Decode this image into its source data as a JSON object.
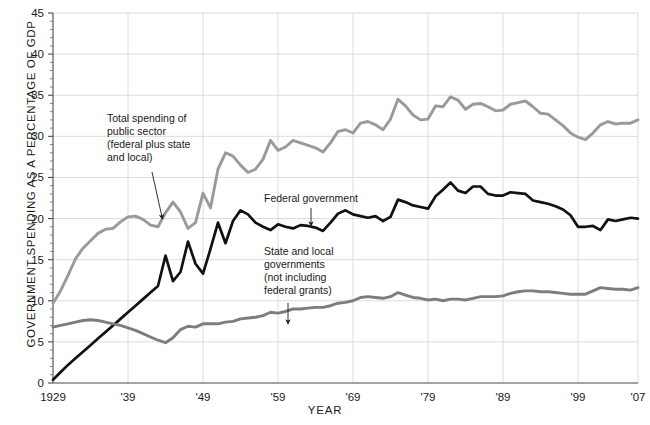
{
  "chart_data": {
    "type": "line",
    "title": "",
    "xlabel": "YEAR",
    "ylabel": "GOVERNMENT SPENDING AS A PERCENTAGE OF GDP",
    "xlim": [
      1929,
      2007
    ],
    "ylim": [
      0,
      45
    ],
    "xticks": [
      1929,
      1939,
      1949,
      1959,
      1969,
      1979,
      1989,
      1999,
      2007
    ],
    "xticklabels": [
      "1929",
      "'39",
      "'49",
      "'59",
      "'69",
      "'79",
      "'89",
      "'99",
      "'07"
    ],
    "yticks": [
      0,
      5,
      10,
      15,
      20,
      25,
      30,
      35,
      40,
      45
    ],
    "yticklabels": [
      "0",
      "5",
      "10",
      "15",
      "20",
      "25",
      "30",
      "35",
      "40",
      "45"
    ],
    "grid": true,
    "legend": "annotations",
    "series": [
      {
        "name": "Total spending of public sector (federal plus state and local)",
        "color": "#9a9a9a",
        "x": [
          1929,
          1930,
          1931,
          1932,
          1933,
          1934,
          1935,
          1936,
          1937,
          1938,
          1939,
          1940,
          1941,
          1942,
          1943,
          1944,
          1945,
          1946,
          1947,
          1948,
          1949,
          1950,
          1951,
          1952,
          1953,
          1954,
          1955,
          1956,
          1957,
          1958,
          1959,
          1960,
          1961,
          1962,
          1963,
          1964,
          1965,
          1966,
          1967,
          1968,
          1969,
          1970,
          1971,
          1972,
          1973,
          1974,
          1975,
          1976,
          1977,
          1978,
          1979,
          1980,
          1981,
          1982,
          1983,
          1984,
          1985,
          1986,
          1987,
          1988,
          1989,
          1990,
          1991,
          1992,
          1993,
          1994,
          1995,
          1996,
          1997,
          1998,
          1999,
          2000,
          2001,
          2002,
          2003,
          2004,
          2005,
          2006,
          2007
        ],
        "y": [
          9.7,
          11.2,
          13.1,
          15.1,
          16.4,
          17.3,
          18.2,
          18.7,
          18.8,
          19.6,
          20.2,
          20.3,
          19.9,
          19.2,
          19.0,
          20.7,
          22.0,
          20.8,
          18.8,
          19.5,
          23.1,
          21.3,
          26.0,
          28.0,
          27.6,
          26.5,
          25.6,
          26.0,
          27.2,
          29.5,
          28.3,
          28.7,
          29.5,
          29.2,
          28.9,
          28.6,
          28.1,
          29.2,
          30.6,
          30.8,
          30.4,
          31.6,
          31.8,
          31.4,
          30.8,
          32.1,
          34.5,
          33.7,
          32.6,
          32.0,
          32.1,
          33.7,
          33.6,
          34.8,
          34.4,
          33.3,
          33.9,
          34.0,
          33.6,
          33.1,
          33.2,
          33.9,
          34.1,
          34.3,
          33.6,
          32.8,
          32.7,
          32.0,
          31.3,
          30.4,
          29.9,
          29.6,
          30.4,
          31.4,
          31.8,
          31.5,
          31.6,
          31.6,
          32.0
        ]
      },
      {
        "name": "Federal government",
        "color": "#111111",
        "x": [
          1929,
          1930,
          1931,
          1932,
          1933,
          1934,
          1935,
          1936,
          1937,
          1938,
          1939,
          1940,
          1941,
          1942,
          1943,
          1944,
          1945,
          1946,
          1947,
          1948,
          1949,
          1950,
          1951,
          1952,
          1953,
          1954,
          1955,
          1956,
          1957,
          1958,
          1959,
          1960,
          1961,
          1962,
          1963,
          1964,
          1965,
          1966,
          1967,
          1968,
          1969,
          1970,
          1971,
          1972,
          1973,
          1974,
          1975,
          1976,
          1977,
          1978,
          1979,
          1980,
          1981,
          1982,
          1983,
          1984,
          1985,
          1986,
          1987,
          1988,
          1989,
          1990,
          1991,
          1992,
          1993,
          1994,
          1995,
          1996,
          1997,
          1998,
          1999,
          2000,
          2001,
          2002,
          2003,
          2004,
          2005,
          2006,
          2007
        ],
        "y": [
          0.4,
          1.3,
          2.2,
          3.0,
          3.8,
          4.6,
          5.4,
          6.2,
          7.0,
          7.8,
          8.6,
          9.4,
          10.2,
          11.0,
          11.8,
          15.5,
          12.4,
          13.5,
          17.2,
          14.5,
          13.3,
          16.3,
          19.5,
          17.0,
          19.7,
          21.0,
          20.5,
          19.5,
          19.0,
          18.6,
          19.3,
          19.0,
          18.8,
          19.2,
          19.1,
          18.9,
          18.5,
          19.5,
          20.6,
          21.0,
          20.5,
          20.3,
          20.1,
          20.3,
          19.7,
          20.2,
          22.3,
          22.0,
          21.6,
          21.4,
          21.2,
          22.7,
          23.5,
          24.4,
          23.4,
          23.1,
          23.9,
          23.9,
          23.0,
          22.8,
          22.8,
          23.2,
          23.1,
          23.0,
          22.2,
          22.0,
          21.8,
          21.5,
          21.1,
          20.4,
          19.0,
          19.0,
          19.1,
          18.6,
          19.9,
          19.7,
          19.9,
          20.1,
          20.0
        ]
      },
      {
        "name": "State and local governments (not including federal grants)",
        "color": "#7d7d7d",
        "x": [
          1929,
          1930,
          1931,
          1932,
          1933,
          1934,
          1935,
          1936,
          1937,
          1938,
          1939,
          1940,
          1941,
          1942,
          1943,
          1944,
          1945,
          1946,
          1947,
          1948,
          1949,
          1950,
          1951,
          1952,
          1953,
          1954,
          1955,
          1956,
          1957,
          1958,
          1959,
          1960,
          1961,
          1962,
          1963,
          1964,
          1965,
          1966,
          1967,
          1968,
          1969,
          1970,
          1971,
          1972,
          1973,
          1974,
          1975,
          1976,
          1977,
          1978,
          1979,
          1980,
          1981,
          1982,
          1983,
          1984,
          1985,
          1986,
          1987,
          1988,
          1989,
          1990,
          1991,
          1992,
          1993,
          1994,
          1995,
          1996,
          1997,
          1998,
          1999,
          2000,
          2001,
          2002,
          2003,
          2004,
          2005,
          2006,
          2007
        ],
        "y": [
          6.8,
          7.0,
          7.2,
          7.4,
          7.6,
          7.7,
          7.6,
          7.4,
          7.2,
          7.0,
          6.7,
          6.4,
          6.0,
          5.6,
          5.2,
          4.9,
          5.5,
          6.5,
          6.9,
          6.8,
          7.2,
          7.2,
          7.2,
          7.4,
          7.5,
          7.8,
          7.9,
          8.0,
          8.2,
          8.6,
          8.5,
          8.7,
          9.0,
          9.0,
          9.1,
          9.2,
          9.2,
          9.4,
          9.7,
          9.8,
          10.0,
          10.4,
          10.5,
          10.4,
          10.3,
          10.5,
          11.0,
          10.7,
          10.4,
          10.3,
          10.1,
          10.2,
          10.0,
          10.2,
          10.2,
          10.1,
          10.3,
          10.5,
          10.5,
          10.5,
          10.6,
          10.9,
          11.1,
          11.2,
          11.2,
          11.1,
          11.1,
          11.0,
          10.9,
          10.8,
          10.8,
          10.8,
          11.2,
          11.6,
          11.5,
          11.4,
          11.4,
          11.3,
          11.6
        ]
      }
    ],
    "annotations": [
      {
        "id": "total-annotation",
        "lines": [
          "Total spending of",
          "public sector",
          "(federal plus state",
          "and local)"
        ],
        "text_x": 107,
        "text_y": 122,
        "arrow": {
          "x1": 152,
          "y1": 172,
          "x2": 162,
          "y2": 217
        }
      },
      {
        "id": "federal-annotation",
        "lines": [
          "Federal government"
        ],
        "text_x": 264,
        "text_y": 202,
        "arrow": {
          "x1": 311,
          "y1": 208,
          "x2": 311,
          "y2": 224
        }
      },
      {
        "id": "state-local-annotation",
        "lines": [
          "State and local",
          "governments",
          "(not including",
          "federal grants)"
        ],
        "text_x": 264,
        "text_y": 255,
        "arrow": {
          "x1": 288,
          "y1": 303,
          "x2": 288,
          "y2": 322
        }
      }
    ]
  }
}
